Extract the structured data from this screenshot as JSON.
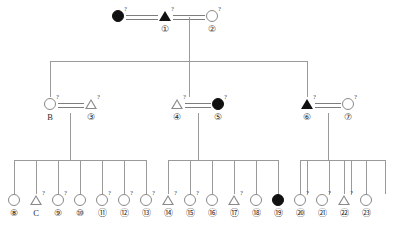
{
  "diagram": {
    "type": "pedigree-chart",
    "title": "",
    "superscript_marker": "?",
    "generations": 3,
    "colors": {
      "line": "#9a9a9a",
      "symbol_outline": "#8a8a8a",
      "filled": "#111111",
      "background": "#ffffff",
      "text": "#2a2a2a"
    }
  },
  "generation1": {
    "name": "generation-I",
    "individuals": [
      {
        "shape": "circle",
        "filled": true,
        "sup": "?",
        "label": "",
        "x": 118,
        "y": 16
      },
      {
        "shape": "triangle",
        "filled": true,
        "sup": "?",
        "label": "①",
        "x": 165,
        "y": 16
      },
      {
        "shape": "circle",
        "filled": false,
        "sup": "?",
        "label": "②",
        "x": 212,
        "y": 16
      }
    ]
  },
  "generation2": {
    "name": "generation-II",
    "individuals": [
      {
        "shape": "circle",
        "filled": false,
        "sup": "?",
        "label": "B",
        "x": 50,
        "y": 104
      },
      {
        "shape": "triangle",
        "filled": false,
        "sup": "?",
        "label": "③",
        "x": 91,
        "y": 104
      },
      {
        "shape": "triangle",
        "filled": false,
        "sup": "?",
        "label": "④",
        "x": 177,
        "y": 104
      },
      {
        "shape": "circle",
        "filled": true,
        "sup": "?",
        "label": "⑤",
        "x": 218,
        "y": 104
      },
      {
        "shape": "triangle",
        "filled": true,
        "sup": "?",
        "label": "⑥",
        "x": 307,
        "y": 104
      },
      {
        "shape": "circle",
        "filled": false,
        "sup": "?",
        "label": "⑦",
        "x": 348,
        "y": 104
      }
    ]
  },
  "generation3": {
    "name": "generation-III",
    "individuals": [
      {
        "shape": "circle",
        "filled": false,
        "sup": "",
        "label": "⑧",
        "x": 14,
        "y": 200
      },
      {
        "shape": "triangle",
        "filled": false,
        "sup": "?",
        "label": "C",
        "x": 36,
        "y": 200
      },
      {
        "shape": "circle",
        "filled": false,
        "sup": "?",
        "label": "⑨",
        "x": 58,
        "y": 200
      },
      {
        "shape": "circle",
        "filled": false,
        "sup": "",
        "label": "⑩",
        "x": 80,
        "y": 200
      },
      {
        "shape": "circle",
        "filled": false,
        "sup": "?",
        "label": "⑪",
        "x": 102,
        "y": 200
      },
      {
        "shape": "circle",
        "filled": false,
        "sup": "?",
        "label": "⑫",
        "x": 124,
        "y": 200
      },
      {
        "shape": "circle",
        "filled": false,
        "sup": "?",
        "label": "⑬",
        "x": 146,
        "y": 200
      },
      {
        "shape": "triangle",
        "filled": false,
        "sup": "?",
        "label": "⑭",
        "x": 168,
        "y": 200
      },
      {
        "shape": "circle",
        "filled": false,
        "sup": "?",
        "label": "⑮",
        "x": 190,
        "y": 200
      },
      {
        "shape": "circle",
        "filled": false,
        "sup": "",
        "label": "⑯",
        "x": 212,
        "y": 200
      },
      {
        "shape": "triangle",
        "filled": false,
        "sup": "?",
        "label": "⑰",
        "x": 234,
        "y": 200
      },
      {
        "shape": "circle",
        "filled": false,
        "sup": "",
        "label": "⑱",
        "x": 256,
        "y": 200
      },
      {
        "shape": "circle",
        "filled": true,
        "sup": "",
        "label": "⑲",
        "x": 278,
        "y": 200
      },
      {
        "shape": "circle",
        "filled": false,
        "sup": "?",
        "label": "⑳",
        "x": 300,
        "y": 200
      },
      {
        "shape": "circle",
        "filled": false,
        "sup": "?",
        "label": "㉑",
        "x": 322,
        "y": 200
      },
      {
        "shape": "triangle",
        "filled": false,
        "sup": "?",
        "label": "㉒",
        "x": 344,
        "y": 200
      },
      {
        "shape": "circle",
        "filled": false,
        "sup": "",
        "label": "㉓",
        "x": 366,
        "y": 200
      },
      {
        "shape": "triangle",
        "filled": false,
        "sup": "?",
        "label": "㉔",
        "x": 307,
        "y": 200
      },
      {
        "shape": "circle",
        "filled": false,
        "sup": "",
        "label": "㉕",
        "x": 329,
        "y": 200
      },
      {
        "shape": "circle",
        "filled": false,
        "sup": "",
        "label": "㉖",
        "x": 351,
        "y": 200
      }
    ]
  },
  "matings": [
    {
      "name": "mating-gen1-left",
      "x": 126,
      "y": 16,
      "w": 32
    },
    {
      "name": "mating-gen1-right",
      "x": 173,
      "y": 16,
      "w": 32
    },
    {
      "name": "mating-gen2-left",
      "x": 58,
      "y": 104,
      "w": 26
    },
    {
      "name": "mating-gen2-middle",
      "x": 185,
      "y": 104,
      "w": 26
    },
    {
      "name": "mating-gen2-right",
      "x": 315,
      "y": 104,
      "w": 26
    }
  ],
  "sibships": [
    {
      "name": "sibship-left",
      "bar_x": 14,
      "bar_w": 132,
      "bar_y": 160,
      "drop_x": 70,
      "drop_top": 113
    },
    {
      "name": "sibship-middle",
      "bar_x": 168,
      "bar_w": 110,
      "bar_y": 160,
      "drop_x": 198,
      "drop_top": 113
    },
    {
      "name": "sibship-right",
      "bar_x": 300,
      "bar_w": 85,
      "bar_y": 160,
      "drop_x": 328,
      "drop_top": 113
    }
  ]
}
